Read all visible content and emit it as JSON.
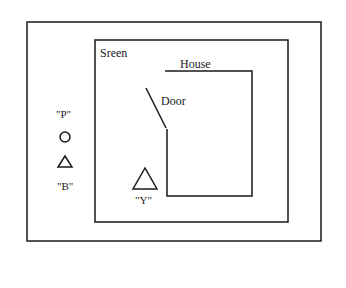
{
  "diagram": {
    "screen_label": "Sreen",
    "house_label": "House",
    "door_label": "Door",
    "outside": {
      "p_label": "\"P\"",
      "p_icon": "circle",
      "b_icon": "triangle",
      "b_label": "\"B\""
    },
    "inside": {
      "y_icon": "triangle",
      "y_label": "\"Y\""
    },
    "colors": {
      "line": "#1a1a1a",
      "background": "#ffffff"
    }
  }
}
